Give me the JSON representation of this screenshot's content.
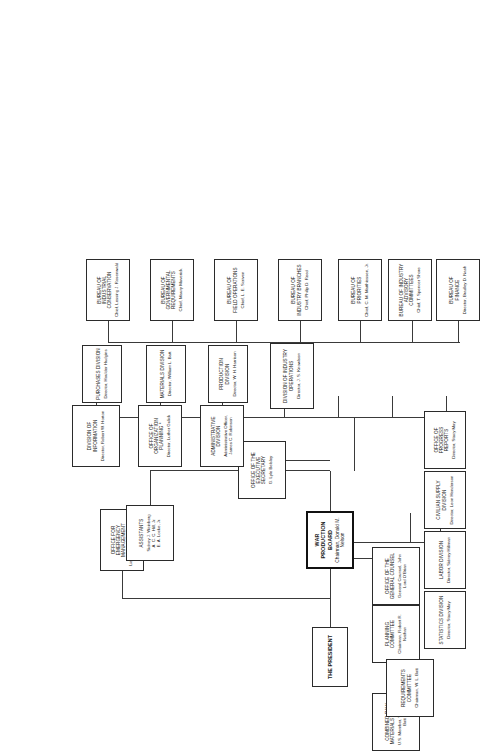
{
  "chart": {
    "type": "org-chart",
    "orientation": "rotated-90-ccw",
    "nodes": {
      "president": {
        "title": "THE PRESIDENT",
        "sub": ""
      },
      "wpb": {
        "title": "WAR PRODUCTION BOARD",
        "sub": "Chairman, Donald M. Nelson"
      },
      "oem": {
        "title": "OFFICE FOR\nEMERGENCY MANAGEMENT",
        "line1": "OFFICE FOR",
        "line2": "EMERGENCY MANAGEMENT",
        "sub": "Liaison Officer, Wayne Coy"
      },
      "assistants": {
        "title": "ASSISTANTS",
        "sub": "Sidney J. Weinberg\nA. C. C. Hill, Jr.\nE. A. Locke, Jr."
      },
      "exec_sec": {
        "line1": "OFFICE OF THE",
        "line2": "EXECUTIVE SECRETARY",
        "sub": "G. Lyle Belsley"
      },
      "gen_counsel": {
        "line1": "OFFICE OF THE",
        "line2": "GENERAL COUNSEL",
        "sub": "General Counsel, John Lord O'Brian"
      },
      "planning_cmte": {
        "title": "PLANNING COMMITTEE",
        "sub": "Chairman, Robert R. Nathan"
      },
      "crmb": {
        "line1": "COMBINED RAW",
        "line2": "MATERIALS BOARD",
        "sub": "U.S. Member, William L. Batt"
      },
      "requirements": {
        "line1": "REQUIREMENTS",
        "line2": "COMMITTEE",
        "sub": "Chairman, W. L. Batt"
      },
      "statistics": {
        "title": "STATISTICS DIVISION",
        "sub": "Director, Stacy May"
      },
      "labor": {
        "title": "LABOR DIVISION",
        "sub": "Director, Sidney Hillman"
      },
      "civilian_supply": {
        "title": "CIVILIAN SUPPLY DIVISION",
        "sub": "Director, Leon Henderson"
      },
      "progress_reports": {
        "line1": "OFFICE OF PROGRESS",
        "line2": "REPORTS",
        "sub": "Director, Stacy May"
      },
      "industry_ops": {
        "title": "DIVISION OF INDUSTRY OPERATIONS",
        "sub": "Director, J. S. Knowlson"
      },
      "production": {
        "title": "PRODUCTION DIVISION",
        "sub": "Director, W. H. Harrison"
      },
      "materials": {
        "title": "MATERIALS DIVISION",
        "sub": "Director, William L. Batt"
      },
      "purchases": {
        "title": "PURCHASES DIVISION",
        "sub": "Director, Houlder Hudgins"
      },
      "administrative": {
        "title": "ADMINISTRATIVE DIVISION",
        "sub": "Administrative Officer,\nJames C. Robinson"
      },
      "org_planning": {
        "line1": "OFFICE OF ORGANIZATION",
        "line2": "PLANNING *",
        "sub": "Director, Luther Gulick"
      },
      "information": {
        "line1": "DIVISION OF",
        "line2": "INFORMATION",
        "sub": "Director, Robert W. Horton"
      },
      "b_finance": {
        "line1": "BUREAU OF",
        "line2": "FINANCE",
        "sub": "Director, Bradley D. Nash"
      },
      "b_adv_cmte": {
        "line1": "BUREAU OF INDUSTRY",
        "line2": "ADVISORY COMMITTEES",
        "sub": "Chief, T. Spencer Shore"
      },
      "b_priorities": {
        "line1": "BUREAU OF",
        "line2": "PRIORITIES",
        "sub": "Chief, C. M. Matthiessen, Jr."
      },
      "b_branches": {
        "line1": "BUREAU OF",
        "line2": "INDUSTRY BRANCHES",
        "sub": "Chief, Philip D. Reed"
      },
      "b_field_ops": {
        "line1": "BUREAU OF",
        "line2": "FIELD OPERATIONS",
        "sub": "Chief, L. E. Scriven"
      },
      "b_govt_req": {
        "line1": "BUREAU OF GOVERNMENTAL",
        "line2": "REQUIREMENTS",
        "sub": "Chief, Maury Maverick"
      },
      "b_ind_cons": {
        "line1": "BUREAU OF",
        "line2": "INDUSTRIAL CONSERVATION",
        "sub": "Chief, Lessing J. Rosenwald"
      }
    }
  }
}
